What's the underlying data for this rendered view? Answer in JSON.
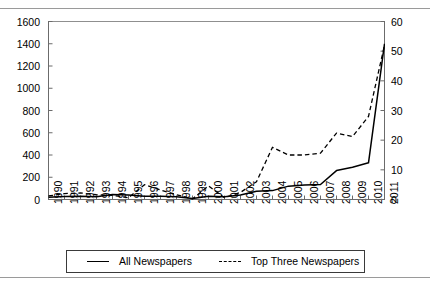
{
  "chart_data": {
    "type": "line",
    "title": "",
    "xlabel": "",
    "ylabel": "",
    "grid": false,
    "legend_position": "bottom",
    "x": [
      1990,
      1991,
      1992,
      1993,
      1994,
      1995,
      1996,
      1997,
      1998,
      1999,
      2000,
      2001,
      2002,
      2003,
      2004,
      2005,
      2006,
      2007,
      2008,
      2009,
      2010,
      2011
    ],
    "xticklabels": [
      "1990",
      "1991",
      "1992",
      "1993",
      "1994",
      "1995",
      "1996",
      "1997",
      "1998",
      "1999",
      "2000",
      "2001",
      "2002",
      "2003",
      "2004",
      "2005",
      "2006",
      "2007",
      "2008",
      "2009",
      "2010",
      "2011"
    ],
    "left_axis": {
      "ylim": [
        0,
        1600
      ],
      "ticks": [
        0,
        200,
        400,
        600,
        800,
        1000,
        1200,
        1400,
        1600
      ],
      "ticklabels": [
        "0",
        "200",
        "400",
        "600",
        "800",
        "1000",
        "1200",
        "1400",
        "1600"
      ]
    },
    "right_axis": {
      "ylim": [
        0,
        60
      ],
      "ticks": [
        0,
        10,
        20,
        30,
        40,
        50,
        60
      ],
      "ticklabels": [
        "0",
        "10",
        "20",
        "30",
        "40",
        "50",
        "60"
      ]
    },
    "series": [
      {
        "name": "All Newspapers",
        "axis": "left",
        "style": "solid",
        "color": "#000000",
        "values": [
          20,
          28,
          30,
          25,
          45,
          40,
          30,
          30,
          25,
          8,
          30,
          25,
          40,
          75,
          80,
          120,
          130,
          135,
          260,
          290,
          330,
          1400
        ]
      },
      {
        "name": "Top Three Newspapers",
        "axis": "right",
        "style": "dashed",
        "color": "#000000",
        "values": [
          1.2,
          2.0,
          2.2,
          1.6,
          1.4,
          0.6,
          5.0,
          3.2,
          1.6,
          0.2,
          4.6,
          0.6,
          2.4,
          6.0,
          17.6,
          15.0,
          15.0,
          15.6,
          22.4,
          21.2,
          28.0,
          52.0
        ]
      }
    ]
  },
  "legend": {
    "items": [
      {
        "label": "All Newspapers",
        "style": "solid"
      },
      {
        "label": "Top Three Newspapers",
        "style": "dashed"
      }
    ]
  }
}
